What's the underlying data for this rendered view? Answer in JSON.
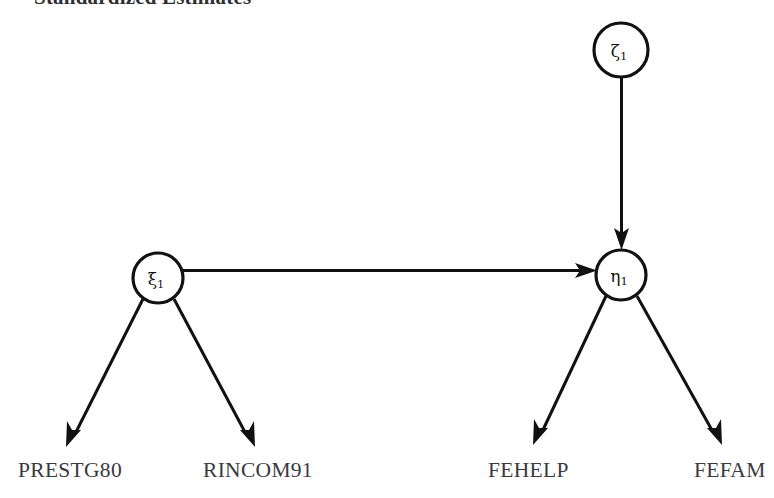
{
  "figure": {
    "title_partial": "Standardized Estimates",
    "background_color": "#ffffff",
    "line_color": "#111111",
    "label_color": "#3a3a3e"
  },
  "latent_nodes": [
    {
      "id": "zeta1",
      "symbol": "ζ",
      "subscript": "1",
      "name": "disturbance-node",
      "cx": 621,
      "cy": 50,
      "r": 27
    },
    {
      "id": "xi1",
      "symbol": "ξ",
      "subscript": "1",
      "name": "exogenous-latent-node",
      "cx": 158,
      "cy": 278,
      "r": 25
    },
    {
      "id": "eta1",
      "symbol": "η",
      "subscript": "1",
      "name": "endogenous-latent-node",
      "cx": 621,
      "cy": 275,
      "r": 25
    }
  ],
  "observed_variables": [
    {
      "id": "prestg80",
      "label": "PRESTG80",
      "x": 18,
      "y": 477
    },
    {
      "id": "rincom91",
      "label": "RINCOM91",
      "x": 203,
      "y": 477
    },
    {
      "id": "fehelp",
      "label": "FEHELP",
      "x": 488,
      "y": 477
    },
    {
      "id": "fefam",
      "label": "FEFAM",
      "x": 694,
      "y": 477
    }
  ],
  "edges": [
    {
      "id": "xi1-to-eta1",
      "from": "xi1",
      "to": "eta1",
      "kind": "structural-path"
    },
    {
      "id": "zeta1-to-eta1",
      "from": "zeta1",
      "to": "eta1",
      "kind": "disturbance-path"
    },
    {
      "id": "xi1-to-prestg80",
      "from": "xi1",
      "to": "prestg80",
      "kind": "loading-path"
    },
    {
      "id": "xi1-to-rincom91",
      "from": "xi1",
      "to": "rincom91",
      "kind": "loading-path"
    },
    {
      "id": "eta1-to-fehelp",
      "from": "eta1",
      "to": "fehelp",
      "kind": "loading-path"
    },
    {
      "id": "eta1-to-fefam",
      "from": "eta1",
      "to": "fefam",
      "kind": "loading-path"
    }
  ]
}
